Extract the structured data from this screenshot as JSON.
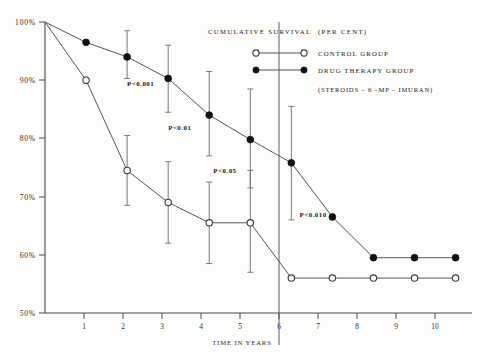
{
  "chart_data": {
    "type": "line",
    "title": "CUMULATIVE  SURVIVAL",
    "subtitle": "(PER CENT)",
    "xlabel": "TIME IN YEARS",
    "ylabel": "",
    "xlim": [
      0,
      10.4
    ],
    "ylim": [
      50,
      100
    ],
    "grid": false,
    "legend_position": "top-right",
    "x": [
      0,
      1,
      2,
      3,
      4,
      5,
      6,
      7,
      8,
      9,
      10
    ],
    "xticklabels": [
      "1",
      "2",
      "3",
      "4",
      "5",
      "6",
      "7",
      "8",
      "9",
      "10"
    ],
    "yticklabels": [
      "100%",
      "90%",
      "80%",
      "70%",
      "60%",
      "50%"
    ],
    "ytickvalues": [
      100,
      90,
      80,
      70,
      60,
      50
    ],
    "series": [
      {
        "name": "CONTROL GROUP",
        "marker": "open-circle",
        "values": [
          100,
          90.0,
          74.5,
          69.0,
          65.5,
          65.5,
          56.0,
          56.0,
          56.0,
          56.0,
          56.0
        ],
        "errors_low": [
          null,
          null,
          68.5,
          62.0,
          58.5,
          57.0,
          null,
          null,
          null,
          null,
          null
        ],
        "errors_high": [
          null,
          null,
          80.5,
          76.0,
          72.5,
          74.5,
          null,
          null,
          null,
          null,
          null
        ]
      },
      {
        "name": "DRUG THERAPY GROUP",
        "marker": "filled-circle",
        "values": [
          100,
          96.5,
          94.0,
          90.3,
          84.0,
          79.8,
          75.8,
          66.5,
          59.5,
          59.5,
          59.5
        ],
        "errors_low": [
          null,
          null,
          90.3,
          84.5,
          77.0,
          71.5,
          66.0,
          null,
          null,
          null,
          null
        ],
        "errors_high": [
          null,
          null,
          98.5,
          96.0,
          91.5,
          88.5,
          85.5,
          null,
          null,
          null,
          null
        ]
      }
    ],
    "annotations": [
      {
        "text": "P<0.001",
        "x": 2.0,
        "y": 89.0
      },
      {
        "text": "P<0.01",
        "x": 3.0,
        "y": 81.5
      },
      {
        "text": "P<0.05",
        "x": 4.1,
        "y": 74.0
      },
      {
        "text": "P<0.010",
        "x": 6.2,
        "y": 66.5
      }
    ]
  },
  "legend": {
    "title": "CUMULATIVE  SURVIVAL",
    "units": "(PER CENT)",
    "entries": [
      {
        "label": "CONTROL GROUP",
        "marker": "open-circle"
      },
      {
        "label": "DRUG THERAPY GROUP",
        "marker": "filled-circle"
      }
    ],
    "note": "(STEROIDS – 6 –MP –  IMURAN)"
  },
  "axis": {
    "x_title": "TIME IN YEARS"
  }
}
